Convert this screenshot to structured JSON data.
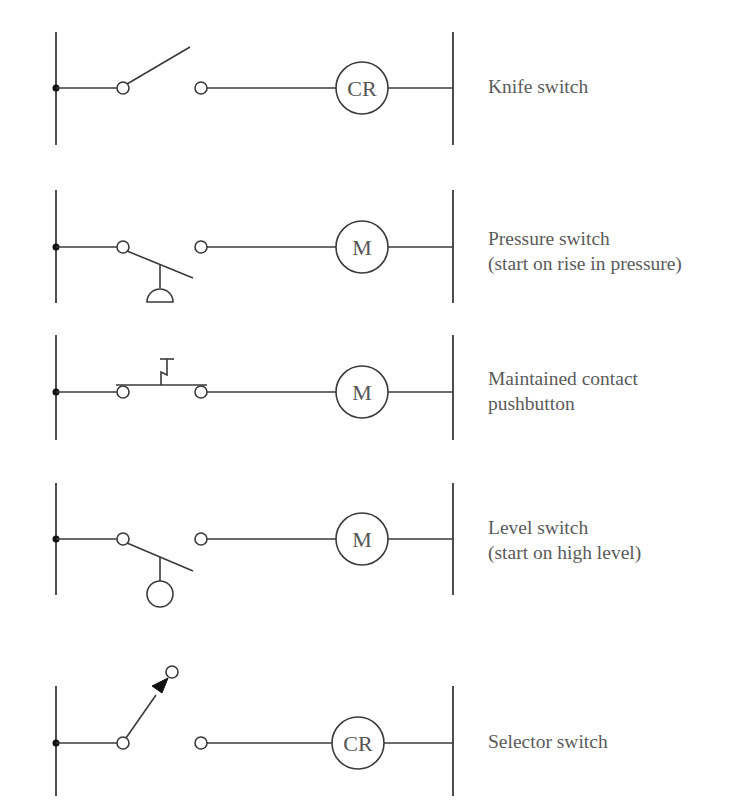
{
  "figure": {
    "type": "ladder-diagram",
    "colors": {
      "line": "#3a3a3a",
      "text": "#5a5a5a",
      "background": "#ffffff"
    },
    "rungs": [
      {
        "id": "knife",
        "coil_label": "CR",
        "symbol": "knife-switch",
        "label_lines": [
          "Knife switch"
        ]
      },
      {
        "id": "pressure",
        "coil_label": "M",
        "symbol": "pressure-switch",
        "label_lines": [
          "Pressure switch",
          "(start on rise in pressure)"
        ]
      },
      {
        "id": "pushbutton",
        "coil_label": "M",
        "symbol": "maintained-contact-pushbutton",
        "label_lines": [
          "Maintained contact",
          "pushbutton"
        ]
      },
      {
        "id": "level",
        "coil_label": "M",
        "symbol": "level-switch",
        "label_lines": [
          "Level switch",
          "(start on high level)"
        ]
      },
      {
        "id": "selector",
        "coil_label": "CR",
        "symbol": "selector-switch",
        "label_lines": [
          "Selector switch"
        ]
      }
    ]
  }
}
